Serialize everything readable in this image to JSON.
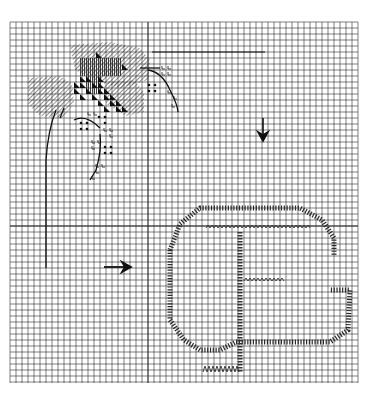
{
  "chart": {
    "type": "cross-stitch-pattern",
    "grid": {
      "x0": 10,
      "y0": 22,
      "x1": 358,
      "y1": 383,
      "cell": 6,
      "line_color": "#2b2b2b",
      "center_vertical_x": 150,
      "center_horizontal_y": 226
    },
    "colors": {
      "ink": "#1a1a1a",
      "paper": "#ffffff",
      "hatch": "#3a3a3a"
    },
    "symbols": [
      {
        "name": "diagonal-hatch",
        "meaning": "leaf stitches"
      },
      {
        "name": "black-triangle",
        "meaning": "dark petal stitches"
      },
      {
        "name": "vertical-lines",
        "meaning": "mid petal stitches"
      },
      {
        "name": "dot",
        "meaning": "bud stitches"
      },
      {
        "name": "L-mark",
        "meaning": "stem/bud stitches"
      },
      {
        "name": "zigzag",
        "meaning": "letter inner outline"
      },
      {
        "name": "backslash",
        "meaning": "letter outer outline"
      }
    ],
    "arrows": [
      {
        "direction": "down",
        "x": 262,
        "y": 120,
        "meaning": "vertical center marker"
      },
      {
        "direction": "right",
        "x": 105,
        "y": 266,
        "meaning": "horizontal center marker"
      }
    ],
    "lines": [
      {
        "name": "top-rule",
        "x1": 152,
        "y1": 52,
        "x2": 265,
        "y2": 52
      },
      {
        "name": "left-rule",
        "x1": 44,
        "y1": 150,
        "x2": 44,
        "y2": 270
      }
    ],
    "motif_letter": "G"
  }
}
